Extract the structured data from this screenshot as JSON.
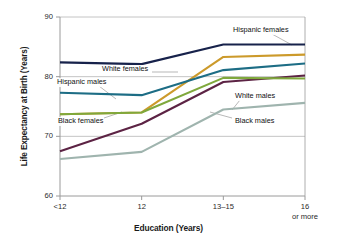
{
  "chart_data": {
    "type": "line",
    "title": "",
    "xlabel": "Education (Years)",
    "ylabel": "Life Expectancy at Birth (Years)",
    "categories": [
      "<12",
      "12",
      "13–15",
      "16"
    ],
    "x_tick_sublabels": [
      "",
      "",
      "",
      "or more"
    ],
    "ylim": [
      60,
      90
    ],
    "yticks": [
      60,
      70,
      80,
      90
    ],
    "ytick_labels": [
      "60",
      "70",
      "80",
      "90"
    ],
    "grid": "horizontal",
    "legend": "inline-annotations",
    "series": [
      {
        "name": "Hispanic females",
        "color": "#17224b",
        "values": [
          82.4,
          82.1,
          85.4,
          85.4
        ],
        "label_x": 232,
        "label_y": 26,
        "leader": [
          [
            272,
            34
          ],
          [
            292,
            45
          ]
        ]
      },
      {
        "name": "White females",
        "color": "#cc9a2b",
        "values": [
          73.7,
          74.0,
          83.3,
          83.7
        ],
        "label_x": 101,
        "label_y": 65,
        "leader": [
          [
            152,
            72
          ],
          [
            178,
            72
          ]
        ]
      },
      {
        "name": "Hispanic males",
        "color": "#1d6d85",
        "values": [
          77.3,
          76.9,
          81.1,
          82.2
        ],
        "label_x": 56,
        "label_y": 78,
        "leader": [
          [
            99,
            86
          ],
          [
            116,
            99
          ]
        ]
      },
      {
        "name": "White males",
        "color": "#5c2344",
        "values": [
          67.5,
          72.1,
          79.1,
          80.2
        ],
        "label_x": 234,
        "label_y": 92,
        "leader": [
          [
            240,
            100
          ],
          [
            232,
            110
          ]
        ]
      },
      {
        "name": "Black females",
        "color": "#7fa83c",
        "values": [
          73.7,
          74.0,
          79.8,
          79.7
        ],
        "label_x": 57,
        "label_y": 117,
        "leader": [
          [
            104,
            118
          ],
          [
            122,
            112
          ]
        ]
      },
      {
        "name": "Black males",
        "color": "#9fb4ae",
        "values": [
          66.2,
          67.4,
          74.5,
          75.6
        ],
        "label_x": 234,
        "label_y": 117,
        "leader": [
          [
            232,
            118
          ],
          [
            210,
            112
          ]
        ]
      }
    ]
  },
  "plot": {
    "left": 60,
    "right": 305,
    "top": 17,
    "bottom": 196,
    "frame_color": "#9a9a9a",
    "grid_color": "#b5b5b5",
    "line_width": 2.1
  }
}
